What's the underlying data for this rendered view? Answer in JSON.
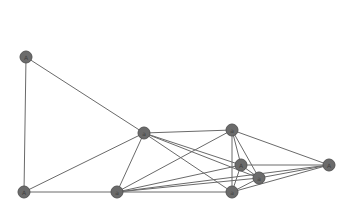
{
  "graph": {
    "node_color": "#6b6b6b",
    "edge_color": "#6a6a6a",
    "node_radius": 6,
    "nodes": [
      {
        "id": "n1",
        "label": "A",
        "x": 26,
        "y": 57
      },
      {
        "id": "n2",
        "label": "a",
        "x": 144,
        "y": 133
      },
      {
        "id": "n3",
        "label": "a",
        "x": 232,
        "y": 130
      },
      {
        "id": "n4",
        "label": "A",
        "x": 241,
        "y": 165
      },
      {
        "id": "n5",
        "label": "a",
        "x": 259,
        "y": 178
      },
      {
        "id": "n6",
        "label": "a",
        "x": 232,
        "y": 192
      },
      {
        "id": "n7",
        "label": "A",
        "x": 329,
        "y": 165
      },
      {
        "id": "n8",
        "label": "a",
        "x": 117,
        "y": 192
      },
      {
        "id": "n9",
        "label": "A",
        "x": 24,
        "y": 192
      }
    ],
    "edges": [
      [
        "n1",
        "n2"
      ],
      [
        "n1",
        "n9"
      ],
      [
        "n2",
        "n9"
      ],
      [
        "n2",
        "n8"
      ],
      [
        "n2",
        "n3"
      ],
      [
        "n2",
        "n4"
      ],
      [
        "n2",
        "n5"
      ],
      [
        "n2",
        "n6"
      ],
      [
        "n9",
        "n8"
      ],
      [
        "n8",
        "n3"
      ],
      [
        "n8",
        "n4"
      ],
      [
        "n8",
        "n5"
      ],
      [
        "n8",
        "n6"
      ],
      [
        "n8",
        "n7"
      ],
      [
        "n3",
        "n7"
      ],
      [
        "n3",
        "n4"
      ],
      [
        "n3",
        "n5"
      ],
      [
        "n3",
        "n6"
      ],
      [
        "n4",
        "n7"
      ],
      [
        "n4",
        "n5"
      ],
      [
        "n4",
        "n6"
      ],
      [
        "n5",
        "n7"
      ],
      [
        "n5",
        "n6"
      ],
      [
        "n6",
        "n7"
      ]
    ]
  }
}
